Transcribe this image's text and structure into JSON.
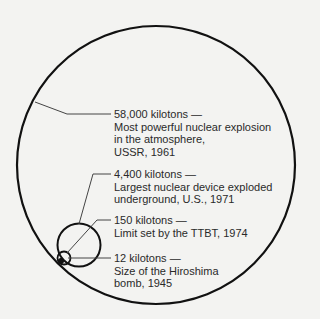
{
  "diagram": {
    "type": "proportional-circles",
    "line_color": "#111111",
    "leader_color": "#444444",
    "background": "#f3f3f1",
    "items": [
      {
        "value": "58,000 kilotons —",
        "lines": [
          "Most powerful nuclear explosion",
          "in the atmosphere,",
          "USSR, 1961"
        ]
      },
      {
        "value": "4,400 kilotons —",
        "lines": [
          "Largest nuclear device exploded",
          "underground, U.S., 1971"
        ]
      },
      {
        "value": "150 kilotons —",
        "lines": [
          "Limit set by the TTBT, 1974"
        ]
      },
      {
        "value": "12 kilotons —",
        "lines": [
          "Size of the Hiroshima",
          "bomb, 1945"
        ]
      }
    ]
  }
}
